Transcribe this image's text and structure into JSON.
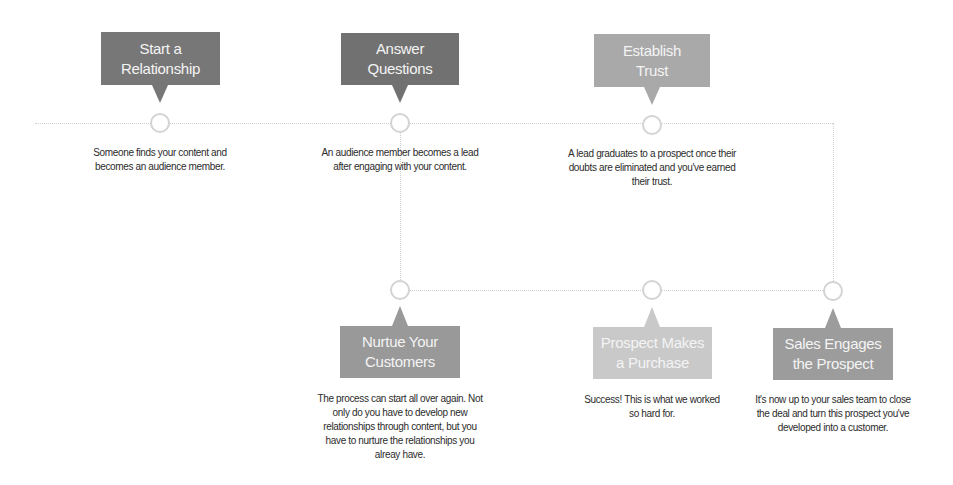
{
  "diagram": {
    "type": "flowchart-timeline",
    "colors": {
      "line": "#cfcfcf",
      "node_border": "#d3d3d3",
      "text": "#2c2c2c",
      "callout_text": "#f4f4f4"
    },
    "steps": [
      {
        "id": "start-relationship",
        "title": "Start a\nRelationship",
        "description": "Someone finds your content and\nbecomes an audience member.",
        "color": "#777777"
      },
      {
        "id": "answer-questions",
        "title": "Answer\nQuestions",
        "description": "An audience member becomes a lead\nafter engaging with your content.",
        "color": "#717171"
      },
      {
        "id": "establish-trust",
        "title": "Establish\nTrust",
        "description": "A lead graduates to a prospect once their\ndoubts are eliminated and you've earned\ntheir trust.",
        "color": "#a9a9a9"
      },
      {
        "id": "sales-engages",
        "title": "Sales Engages\nthe Prospect",
        "description": "It's now up to your sales team to close\nthe deal and turn this prospect you've\ndeveloped into a customer.",
        "color": "#9c9c9c"
      },
      {
        "id": "prospect-purchase",
        "title": "Prospect Makes\na Purchase",
        "description": "Success! This is what we worked\nso hard for.",
        "color": "#c9c9c9"
      },
      {
        "id": "nurture-customers",
        "title": "Nurtue Your\nCustomers",
        "description": "The process can start all over again. Not\nonly do you have to develop new\nrelationships through content, but you\nhave to nurture the relationships you\nalreay have.",
        "color": "#999999"
      }
    ]
  }
}
